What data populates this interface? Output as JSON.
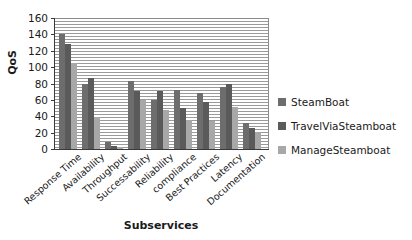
{
  "chart_data": {
    "type": "bar",
    "title": "",
    "xlabel": "Subservices",
    "ylabel": "QoS",
    "ylim": [
      0,
      160
    ],
    "ytick_step": 20,
    "yticks": [
      160,
      140,
      120,
      100,
      80,
      60,
      40,
      20,
      0
    ],
    "grid": true,
    "grid_orientation": "horizontal",
    "legend_position": "right",
    "categories": [
      "Response Time",
      "Availability",
      "Throughput",
      "Successability",
      "Reliability",
      "compliance",
      "Best Practices",
      "Latency",
      "Documentation"
    ],
    "series": [
      {
        "name": "SteamBoat",
        "color": "#6d6d6d",
        "values": [
          140,
          80,
          8,
          83,
          60,
          72,
          68,
          76,
          32
        ]
      },
      {
        "name": "TravelViaSteamboat",
        "color": "#5a5a5a",
        "values": [
          128,
          87,
          4,
          71,
          71,
          50,
          57,
          80,
          26
        ]
      },
      {
        "name": "ManageSteamboat",
        "color": "#a8a8a8",
        "values": [
          105,
          39,
          2,
          60,
          48,
          36,
          34,
          51,
          21
        ]
      }
    ]
  }
}
